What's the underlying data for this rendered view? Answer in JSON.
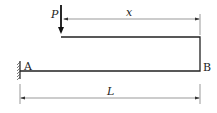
{
  "diagram": {
    "load_label": "P",
    "point_a_label": "A",
    "point_b_label": "B",
    "offset_dimension_label": "x",
    "length_dimension_label": "L",
    "line_color": "#222222"
  }
}
